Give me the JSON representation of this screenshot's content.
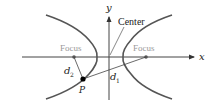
{
  "diagram": {
    "axes": {
      "x_label": "x",
      "y_label": "y"
    },
    "labels": {
      "center": "Center",
      "focus_left": "Focus",
      "focus_right": "Focus",
      "point": "P",
      "d1_base": "d",
      "d1_sub": "1",
      "d2_base": "d",
      "d2_sub": "2"
    },
    "colors": {
      "curve": "#555555",
      "axis": "#444444",
      "focus_text": "#999999",
      "text": "#222222",
      "point": "#000000"
    }
  }
}
